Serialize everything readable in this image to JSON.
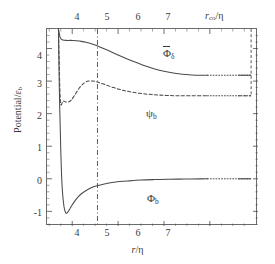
{
  "figure": {
    "title": "",
    "background": "#ffffff",
    "line_color": "#4a4a4a",
    "frame_color": "#6b6b6b"
  },
  "axes": {
    "ylabel_text": "Potential/",
    "ylabel_symbol": "ε",
    "ylabel_sub": "b",
    "xlabel_bottom_symbol": "r",
    "xlabel_bottom_unit": "/η",
    "xlabel_top_symbol": "r",
    "xlabel_top_sub": "co",
    "xlabel_top_unit": "/η",
    "xticks_bottom": [
      "4",
      "5",
      "6",
      "7"
    ],
    "xticks_top": [
      "4",
      "5",
      "6",
      "7"
    ],
    "yticks": [
      "4",
      "3",
      "2",
      "1",
      "0",
      "-1"
    ]
  },
  "annotations": {
    "phi_delta": {
      "symbol": "Φ",
      "sub": "δ",
      "overbar": true
    },
    "psi_b": {
      "symbol": "ψ",
      "sub": "b",
      "overbar": false
    },
    "phi_b": {
      "symbol": "Φ",
      "sub": "b",
      "overbar": false
    }
  },
  "chart_data": {
    "type": "line",
    "title": "",
    "xlabel": "r/η",
    "ylabel": "Potential/ε_b",
    "xlim": [
      3.45,
      8.05
    ],
    "ylim": [
      -1.45,
      4.6
    ],
    "grid": false,
    "legend": "in-plot labels",
    "xticks": [
      4,
      5,
      6,
      7
    ],
    "yticks": [
      -1,
      0,
      1,
      2,
      3,
      4
    ],
    "vertical_markers": [
      {
        "name": "dash-dot-marker",
        "x": 4.55,
        "style": "dash-dot",
        "from_y": -1.45,
        "to_y": 4.6
      },
      {
        "name": "cutoff-radius-line",
        "x": 7.9,
        "style": "dashed",
        "from_y": 2.55,
        "to_y": 4.6
      }
    ],
    "series": [
      {
        "name": "Φ̄_δ",
        "label": "Phi-bar-delta",
        "style": "solid",
        "tail_style": "dotted",
        "tail_start_x": 6.95,
        "tail_end_x": 7.9,
        "x": [
          3.7,
          3.74,
          3.8,
          3.9,
          4.0,
          4.1,
          4.2,
          4.3,
          4.45,
          4.6,
          4.8,
          5.0,
          5.2,
          5.4,
          5.6,
          5.8,
          6.0,
          6.2,
          6.4,
          6.6,
          6.8,
          6.95
        ],
        "y": [
          4.6,
          4.33,
          4.26,
          4.25,
          4.25,
          4.24,
          4.22,
          4.19,
          4.13,
          4.05,
          3.93,
          3.8,
          3.68,
          3.57,
          3.46,
          3.37,
          3.3,
          3.25,
          3.21,
          3.19,
          3.18,
          3.18
        ]
      },
      {
        "name": "ψ_b",
        "label": "psi-b",
        "style": "dashed",
        "tail_style": "dotted",
        "tail_start_x": 6.95,
        "tail_end_x": 7.9,
        "x": [
          3.7,
          3.74,
          3.8,
          3.86,
          3.92,
          3.98,
          4.05,
          4.15,
          4.25,
          4.35,
          4.45,
          4.55,
          4.7,
          4.9,
          5.1,
          5.3,
          5.55,
          5.8,
          6.05,
          6.3,
          6.6,
          6.95
        ],
        "y": [
          4.6,
          2.44,
          2.39,
          2.36,
          2.36,
          2.42,
          2.56,
          2.78,
          2.93,
          3.0,
          3.0,
          2.97,
          2.9,
          2.8,
          2.72,
          2.66,
          2.61,
          2.58,
          2.56,
          2.55,
          2.55,
          2.55
        ]
      },
      {
        "name": "Φ_b",
        "label": "Phi-b",
        "style": "solid",
        "tail_style": "dotted",
        "tail_start_x": 6.95,
        "tail_end_x": 7.9,
        "x": [
          3.7,
          3.72,
          3.75,
          3.78,
          3.82,
          3.86,
          3.9,
          3.95,
          4.0,
          4.1,
          4.2,
          4.35,
          4.5,
          4.7,
          4.95,
          5.2,
          5.5,
          5.8,
          6.1,
          6.45,
          6.8,
          6.95
        ],
        "y": [
          4.6,
          2.7,
          0.9,
          -0.25,
          -0.85,
          -1.05,
          -1.03,
          -0.92,
          -0.8,
          -0.6,
          -0.46,
          -0.32,
          -0.23,
          -0.16,
          -0.1,
          -0.07,
          -0.04,
          -0.025,
          -0.015,
          -0.008,
          -0.003,
          0.0
        ]
      }
    ]
  }
}
